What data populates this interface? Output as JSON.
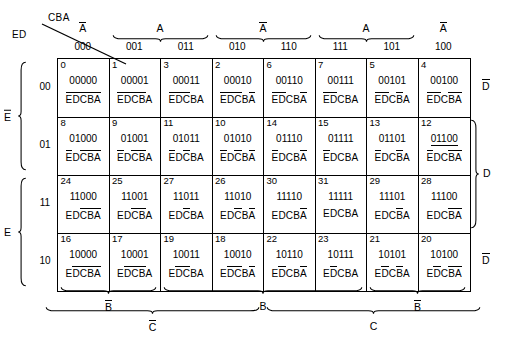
{
  "corner": {
    "row_vars": "ED",
    "col_vars": "CBA"
  },
  "column_headers": [
    "000",
    "001",
    "011",
    "010",
    "110",
    "111",
    "101",
    "100"
  ],
  "column_groups": [
    {
      "label": "A",
      "overbar": true,
      "start": 0,
      "span": 1,
      "brace": false
    },
    {
      "label": "A",
      "overbar": false,
      "start": 1,
      "span": 2,
      "brace": true
    },
    {
      "label": "A",
      "overbar": true,
      "start": 3,
      "span": 2,
      "brace": true
    },
    {
      "label": "A",
      "overbar": false,
      "start": 5,
      "span": 2,
      "brace": true
    },
    {
      "label": "A",
      "overbar": true,
      "start": 7,
      "span": 1,
      "brace": false
    }
  ],
  "row_headers": [
    "00",
    "01",
    "11",
    "10"
  ],
  "row_groups": [
    {
      "label": "E",
      "overbar": true,
      "start": 0,
      "span": 2
    },
    {
      "label": "E",
      "overbar": false,
      "start": 2,
      "span": 2
    }
  ],
  "right_labels": [
    {
      "label": "D",
      "overbar": true,
      "start": 0,
      "span": 1,
      "brace": false
    },
    {
      "label": "D",
      "overbar": false,
      "start": 1,
      "span": 2,
      "brace": true
    },
    {
      "label": "D",
      "overbar": true,
      "start": 3,
      "span": 1,
      "brace": false
    }
  ],
  "bottom_groups_b": [
    {
      "label": "B",
      "overbar": true,
      "start": 0,
      "span": 2
    },
    {
      "label": "B",
      "overbar": false,
      "start": 2,
      "span": 4
    },
    {
      "label": "B",
      "overbar": true,
      "start": 6,
      "span": 2
    }
  ],
  "bottom_groups_c": [
    {
      "label": "C",
      "overbar": true,
      "start": 0,
      "span": 4
    },
    {
      "label": "C",
      "overbar": false,
      "start": 4,
      "span": 4
    }
  ],
  "cells": [
    [
      {
        "index": "0",
        "binary": "00000",
        "bars": [
          true,
          true,
          true,
          true,
          true
        ],
        "underline": false
      },
      {
        "index": "1",
        "binary": "00001",
        "bars": [
          true,
          true,
          true,
          true,
          false
        ],
        "underline": false
      },
      {
        "index": "3",
        "binary": "00011",
        "bars": [
          true,
          true,
          true,
          false,
          false
        ],
        "underline": false
      },
      {
        "index": "2",
        "binary": "00010",
        "bars": [
          true,
          true,
          true,
          false,
          true
        ],
        "underline": false
      },
      {
        "index": "6",
        "binary": "00110",
        "bars": [
          true,
          true,
          false,
          false,
          true
        ],
        "underline": false
      },
      {
        "index": "7",
        "binary": "00111",
        "bars": [
          true,
          true,
          false,
          false,
          false
        ],
        "underline": false
      },
      {
        "index": "5",
        "binary": "00101",
        "bars": [
          true,
          true,
          false,
          true,
          false
        ],
        "underline": false
      },
      {
        "index": "4",
        "binary": "00100",
        "bars": [
          true,
          true,
          false,
          true,
          true
        ],
        "underline": false
      }
    ],
    [
      {
        "index": "8",
        "binary": "01000",
        "bars": [
          true,
          false,
          true,
          true,
          true
        ],
        "underline": false
      },
      {
        "index": "9",
        "binary": "01001",
        "bars": [
          true,
          false,
          true,
          true,
          false
        ],
        "underline": false
      },
      {
        "index": "11",
        "binary": "01011",
        "bars": [
          true,
          false,
          true,
          false,
          false
        ],
        "underline": false
      },
      {
        "index": "10",
        "binary": "01010",
        "bars": [
          true,
          false,
          true,
          false,
          true
        ],
        "underline": false
      },
      {
        "index": "14",
        "binary": "01110",
        "bars": [
          true,
          false,
          false,
          false,
          true
        ],
        "underline": false
      },
      {
        "index": "15",
        "binary": "01111",
        "bars": [
          true,
          false,
          false,
          false,
          false
        ],
        "underline": false
      },
      {
        "index": "13",
        "binary": "01101",
        "bars": [
          true,
          false,
          false,
          true,
          false
        ],
        "underline": false
      },
      {
        "index": "12",
        "binary": "01100",
        "bars": [
          true,
          false,
          false,
          true,
          true
        ],
        "underline": true
      }
    ],
    [
      {
        "index": "24",
        "binary": "11000",
        "bars": [
          false,
          false,
          true,
          true,
          true
        ],
        "underline": false
      },
      {
        "index": "25",
        "binary": "11001",
        "bars": [
          false,
          false,
          true,
          true,
          false
        ],
        "underline": false
      },
      {
        "index": "27",
        "binary": "11011",
        "bars": [
          false,
          false,
          true,
          false,
          false
        ],
        "underline": false
      },
      {
        "index": "26",
        "binary": "11010",
        "bars": [
          false,
          false,
          true,
          false,
          true
        ],
        "underline": false
      },
      {
        "index": "30",
        "binary": "11110",
        "bars": [
          false,
          false,
          false,
          false,
          true
        ],
        "underline": false
      },
      {
        "index": "31",
        "binary": "11111",
        "bars": [
          false,
          false,
          false,
          false,
          false
        ],
        "underline": false
      },
      {
        "index": "29",
        "binary": "11101",
        "bars": [
          false,
          false,
          false,
          true,
          false
        ],
        "underline": false
      },
      {
        "index": "28",
        "binary": "11100",
        "bars": [
          false,
          false,
          false,
          true,
          true
        ],
        "underline": false
      }
    ],
    [
      {
        "index": "16",
        "binary": "10000",
        "bars": [
          false,
          true,
          true,
          true,
          true
        ],
        "underline": false
      },
      {
        "index": "17",
        "binary": "10001",
        "bars": [
          false,
          true,
          true,
          true,
          false
        ],
        "underline": false
      },
      {
        "index": "19",
        "binary": "10011",
        "bars": [
          false,
          true,
          true,
          false,
          false
        ],
        "underline": false
      },
      {
        "index": "18",
        "binary": "10010",
        "bars": [
          false,
          true,
          true,
          false,
          true
        ],
        "underline": false
      },
      {
        "index": "22",
        "binary": "10110",
        "bars": [
          false,
          true,
          false,
          false,
          true
        ],
        "underline": false
      },
      {
        "index": "23",
        "binary": "10111",
        "bars": [
          false,
          true,
          false,
          false,
          false
        ],
        "underline": false
      },
      {
        "index": "21",
        "binary": "10101",
        "bars": [
          false,
          true,
          false,
          true,
          false
        ],
        "underline": false
      },
      {
        "index": "20",
        "binary": "10100",
        "bars": [
          false,
          true,
          false,
          true,
          true
        ],
        "underline": false
      }
    ]
  ],
  "minterm_letters": [
    "E",
    "D",
    "C",
    "B",
    "A"
  ]
}
